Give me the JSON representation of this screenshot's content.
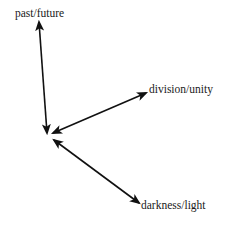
{
  "diagram": {
    "type": "axes-from-origin",
    "colors": {
      "line": "#111111",
      "text": "#1a1a1a",
      "background": "#ffffff"
    },
    "axes": [
      {
        "id": "time",
        "label": "past/future",
        "arrowheads": "both"
      },
      {
        "id": "unity",
        "label": "division/unity",
        "arrowheads": "both"
      },
      {
        "id": "light",
        "label": "darkness/light",
        "arrowheads": "both"
      }
    ]
  }
}
